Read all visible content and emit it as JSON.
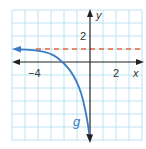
{
  "graph": {
    "x_axis_label": "x",
    "y_axis_label": "y",
    "x_tick_labels": [
      {
        "value": -4,
        "text": "−4"
      },
      {
        "value": 2,
        "text": "2"
      }
    ],
    "y_tick_labels": [
      {
        "value": 2,
        "text": "2"
      }
    ],
    "curve_label": "g",
    "asymptote": {
      "y": 1,
      "style": "dashed",
      "color": "#e8673c"
    },
    "curve_color": "#3a7cc4",
    "grid_color": "#bfe3f2",
    "axis_color": "#222222",
    "grid_step": 1,
    "x_range": [
      -6,
      4
    ],
    "y_range": [
      -6,
      4
    ]
  }
}
